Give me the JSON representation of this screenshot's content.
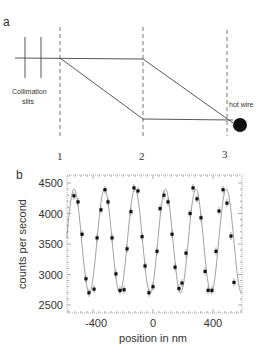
{
  "panel_a": {
    "label": "a",
    "slits_label_line1": "Collimation",
    "slits_label_line2": "slits",
    "hot_wire_label": "hot wire",
    "positions": [
      "1",
      "2",
      "3"
    ]
  },
  "panel_b": {
    "label": "b"
  },
  "chart_data": {
    "type": "scatter",
    "title": "",
    "xlabel": "position in nm",
    "ylabel": "counts per second",
    "xlim": [
      -575,
      590
    ],
    "ylim": [
      2380,
      4550
    ],
    "xticks": [
      "-400",
      "0",
      "400"
    ],
    "yticks": [
      "2500",
      "3000",
      "3500",
      "4000",
      "4500"
    ],
    "grid": false,
    "legend": null,
    "series": [
      {
        "name": "measured (with error bars)",
        "x": [
          -527,
          -500,
          -473,
          -447,
          -427,
          -393,
          -373,
          -347,
          -320,
          -300,
          -273,
          -247,
          -220,
          -193,
          -173,
          -147,
          -127,
          -100,
          -73,
          -53,
          -27,
          0,
          27,
          47,
          73,
          100,
          127,
          147,
          173,
          193,
          220,
          247,
          267,
          293,
          320,
          347,
          367,
          393,
          420,
          440,
          467,
          493,
          520,
          540
        ],
        "y": [
          4290,
          4190,
          3660,
          2930,
          2700,
          2760,
          3600,
          4060,
          4390,
          4190,
          3600,
          3010,
          2740,
          2750,
          3420,
          4030,
          4420,
          4370,
          3620,
          3140,
          2700,
          2800,
          3380,
          4080,
          4300,
          4190,
          3660,
          3120,
          2770,
          2860,
          3350,
          4000,
          4420,
          4240,
          3930,
          3050,
          2740,
          2740,
          3380,
          4040,
          4390,
          4170,
          3630,
          2870
        ]
      },
      {
        "name": "sinusoidal fit",
        "model": "3550 + 850*sin(2*pi*(x+577)/203)",
        "period_nm": 203,
        "mean": 3550,
        "amplitude": 850
      }
    ]
  }
}
